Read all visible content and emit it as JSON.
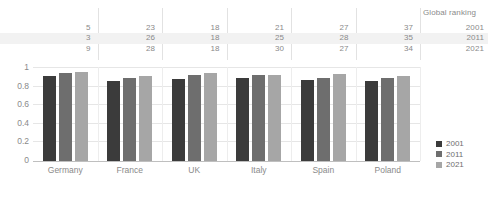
{
  "chart_data": {
    "type": "bar",
    "title": "",
    "subtitle": "",
    "xlabel": "",
    "ylabel": "",
    "ylim": [
      0,
      1
    ],
    "yticks": [
      "1",
      "0.8",
      "0.6",
      "0.4",
      "0.2",
      "0"
    ],
    "ytick_values": [
      1,
      0.8,
      0.6,
      0.4,
      0.2,
      0
    ],
    "grid": true,
    "legend_position": "right",
    "categories": [
      "Germany",
      "France",
      "UK",
      "Italy",
      "Spain",
      "Poland"
    ],
    "series": [
      {
        "name": "2001",
        "color": "#3b3b3b",
        "values": [
          0.9,
          0.85,
          0.875,
          0.885,
          0.865,
          0.85
        ]
      },
      {
        "name": "2011",
        "color": "#6e6e6e",
        "values": [
          0.94,
          0.885,
          0.915,
          0.915,
          0.885,
          0.885
        ]
      },
      {
        "name": "2021",
        "color": "#a6a6a6",
        "values": [
          0.95,
          0.905,
          0.94,
          0.92,
          0.925,
          0.9
        ]
      }
    ],
    "annotation_table": {
      "title": "Global ranking",
      "row_labels": [
        "2001",
        "2011",
        "2021"
      ],
      "rows": [
        {
          "year": "2001",
          "values": [
            "5",
            "23",
            "18",
            "21",
            "27",
            "37"
          ]
        },
        {
          "year": "2011",
          "values": [
            "3",
            "26",
            "18",
            "25",
            "28",
            "35"
          ]
        },
        {
          "year": "2021",
          "values": [
            "9",
            "28",
            "18",
            "30",
            "27",
            "34"
          ]
        }
      ]
    }
  },
  "table": {
    "header_title": "Global ranking",
    "rows": [
      {
        "label": "2001",
        "c0": "5",
        "c1": "23",
        "c2": "18",
        "c3": "21",
        "c4": "27",
        "c5": "37"
      },
      {
        "label": "2011",
        "c0": "3",
        "c1": "26",
        "c2": "18",
        "c3": "25",
        "c4": "28",
        "c5": "35"
      },
      {
        "label": "2021",
        "c0": "9",
        "c1": "28",
        "c2": "18",
        "c3": "30",
        "c4": "27",
        "c5": "34"
      }
    ]
  },
  "axis": {
    "y": {
      "t0": "1",
      "t1": "0.8",
      "t2": "0.6",
      "t3": "0.4",
      "t4": "0.2",
      "t5": "0"
    },
    "x": {
      "c0": "Germany",
      "c1": "France",
      "c2": "UK",
      "c3": "Italy",
      "c4": "Spain",
      "c5": "Poland"
    }
  },
  "legend": {
    "items": [
      {
        "label": "2001",
        "color": "#3b3b3b"
      },
      {
        "label": "2011",
        "color": "#6e6e6e"
      },
      {
        "label": "2021",
        "color": "#a6a6a6"
      }
    ]
  },
  "colors": {
    "series_2001": "#3b3b3b",
    "series_2011": "#6e6e6e",
    "series_2021": "#a6a6a6",
    "text": "#8a8a8a",
    "grid": "#e6e6e6",
    "band": "#f2f2f2",
    "background": "#ffffff"
  }
}
